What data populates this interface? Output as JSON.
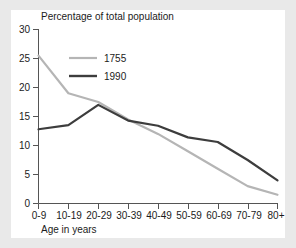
{
  "chart_data": {
    "type": "line",
    "title": "Percentage of total population",
    "xlabel": "Age in years",
    "ylabel": "",
    "categories": [
      "0-9",
      "10-19",
      "20-29",
      "30-39",
      "40-49",
      "50-59",
      "60-69",
      "70-79",
      "80+"
    ],
    "series": [
      {
        "name": "1755",
        "color": "#b5b5b5",
        "values": [
          25.5,
          19.0,
          17.5,
          14.5,
          12.0,
          9.0,
          6.0,
          3.0,
          1.5
        ]
      },
      {
        "name": "1990",
        "color": "#3d3d3d",
        "values": [
          12.8,
          13.5,
          17.0,
          14.3,
          13.4,
          11.4,
          10.6,
          7.5,
          4.0
        ]
      }
    ],
    "ylim": [
      0,
      30
    ],
    "yticks": [
      0,
      5,
      10,
      15,
      20,
      25,
      30
    ],
    "ytick_labels": [
      "0",
      "5",
      "10",
      "15",
      "20",
      "25",
      "30"
    ],
    "grid": false,
    "legend_position": "top-left-inside"
  },
  "legend": {
    "entries": [
      {
        "label": "1755"
      },
      {
        "label": "1990"
      }
    ]
  },
  "colors": {
    "series_1755": "#b5b5b5",
    "series_1990": "#3d3d3d",
    "axis": "#555555",
    "text": "#1b1b1b",
    "panel_background": "#ffffff",
    "page_background": "#e9e9e9"
  }
}
